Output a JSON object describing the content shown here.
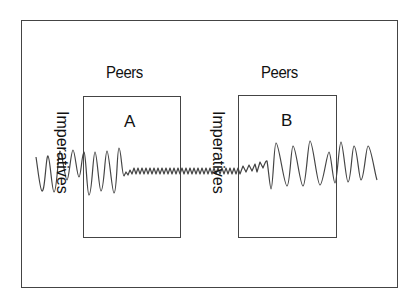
{
  "diagram": {
    "frame": {
      "label": ""
    },
    "left_group": {
      "heading": "Peers",
      "box_label": "A",
      "side_label": "Imperatives"
    },
    "right_group": {
      "heading": "Peers",
      "box_label": "B",
      "side_label": "Imperatives"
    },
    "signal": {
      "description": "Oscillating wave passing through both boxes: large amplitude on left, small amplitude between A and B, large amplitude again in B",
      "stroke_color": "#444444"
    }
  }
}
